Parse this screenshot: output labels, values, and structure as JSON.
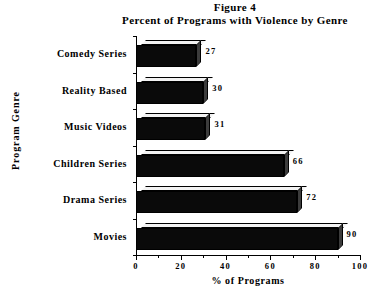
{
  "title": {
    "figure_line": "Figure 4",
    "main_line": "Percent of Programs with Violence by Genre"
  },
  "chart_data": {
    "type": "bar",
    "orientation": "horizontal",
    "xlabel": "% of Programs",
    "ylabel": "Program Genre",
    "categories": [
      "Comedy Series",
      "Reality Based",
      "Music Videos",
      "Children Series",
      "Drama Series",
      "Movies"
    ],
    "values": [
      27,
      30,
      31,
      66,
      72,
      90
    ],
    "value_labels": [
      "27",
      "30",
      "31",
      "66",
      "72",
      "90"
    ],
    "xlim": [
      0,
      100
    ],
    "xticks": [
      0,
      20,
      40,
      60,
      80,
      100
    ],
    "xtick_labels": [
      "0",
      "20",
      "40",
      "60",
      "80",
      "100"
    ],
    "minor_xticks": [
      10,
      30,
      50,
      70,
      90
    ],
    "grid": false,
    "legend": null,
    "style": {
      "bar_face_color": "#0a0a0a",
      "bar_top_color": "#f2f2f2",
      "bar_side_pattern": "checkered-gray",
      "background": "#ffffff",
      "axis_color": "#000000",
      "three_d": true
    }
  }
}
